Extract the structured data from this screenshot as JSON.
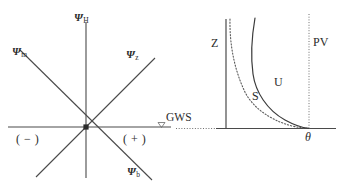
{
  "figure": {
    "background": "#ffffff",
    "ink": "#2b2b2b"
  },
  "left_panel": {
    "name": "water-potential-axes",
    "origin": {
      "x": 86,
      "y": 127
    },
    "axis_labels": {
      "vertical_top": {
        "symbol": "Ψ",
        "subscript": "H"
      },
      "diagonal_up_right": {
        "symbol": "Ψ",
        "subscript": "z"
      },
      "diagonal_up_left": {
        "symbol": "Ψ",
        "subscript": "m"
      },
      "diagonal_down_right": {
        "symbol": "Ψ",
        "subscript": "b"
      }
    },
    "sign_negative": "( − )",
    "sign_positive": "( + )",
    "gws_label": "GWS",
    "gws_marker": "down-triangle"
  },
  "right_panel": {
    "name": "soil-water-curves",
    "z_axis_label": "Z",
    "pv_line_label": "PV",
    "curve_s_label": "S",
    "curve_u_label": "U",
    "theta_label": "θ",
    "curves": [
      {
        "id": "S",
        "style": "dotted"
      },
      {
        "id": "U",
        "style": "solid"
      }
    ]
  }
}
